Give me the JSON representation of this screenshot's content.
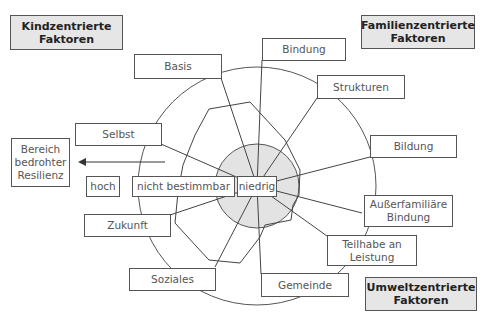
{
  "categories": {
    "child": "Kindzentrierte\nFaktoren",
    "family": "Familienzentrierte\nFaktoren",
    "environment": "Umweltzentrierte\nFaktoren"
  },
  "factors": {
    "basis": "Basis",
    "selbst": "Selbst",
    "zukunft": "Zukunft",
    "soziales": "Soziales",
    "gemeinde": "Gemeinde",
    "teilhabe": "Teilhabe an\nLeistung",
    "ausserfamiliaere": "Außerfamiliäre\nBindung",
    "bildung": "Bildung",
    "strukturen": "Strukturen",
    "bindung": "Bindung"
  },
  "scale": {
    "niedrig": "niedrig",
    "nicht_bestimmbar": "nicht bestimmbar",
    "hoch": "hoch"
  },
  "zone": "Bereich\nbedrohter\nResilienz",
  "colors": {
    "inner_fill": "#e3e3e3",
    "category_fill": "#e6e6e6",
    "line": "#444444"
  }
}
